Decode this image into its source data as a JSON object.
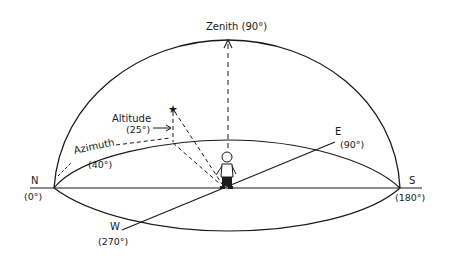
{
  "diagram": {
    "labels": {
      "zenith": "Zenith (90°)",
      "altitude": "Altitude",
      "altitude_value": "(25°)",
      "azimuth": "Azimuth",
      "azimuth_value": "(40°)",
      "north": "N",
      "north_value": "(0°)",
      "east": "E",
      "east_value": "(90°)",
      "south": "S",
      "south_value": "(180°)",
      "west": "W",
      "west_value": "(270°)"
    },
    "elements": {
      "star": "★",
      "observer": "person standing at center"
    },
    "colors": {
      "line": "#1a1a1a",
      "background": "#ffffff"
    }
  }
}
